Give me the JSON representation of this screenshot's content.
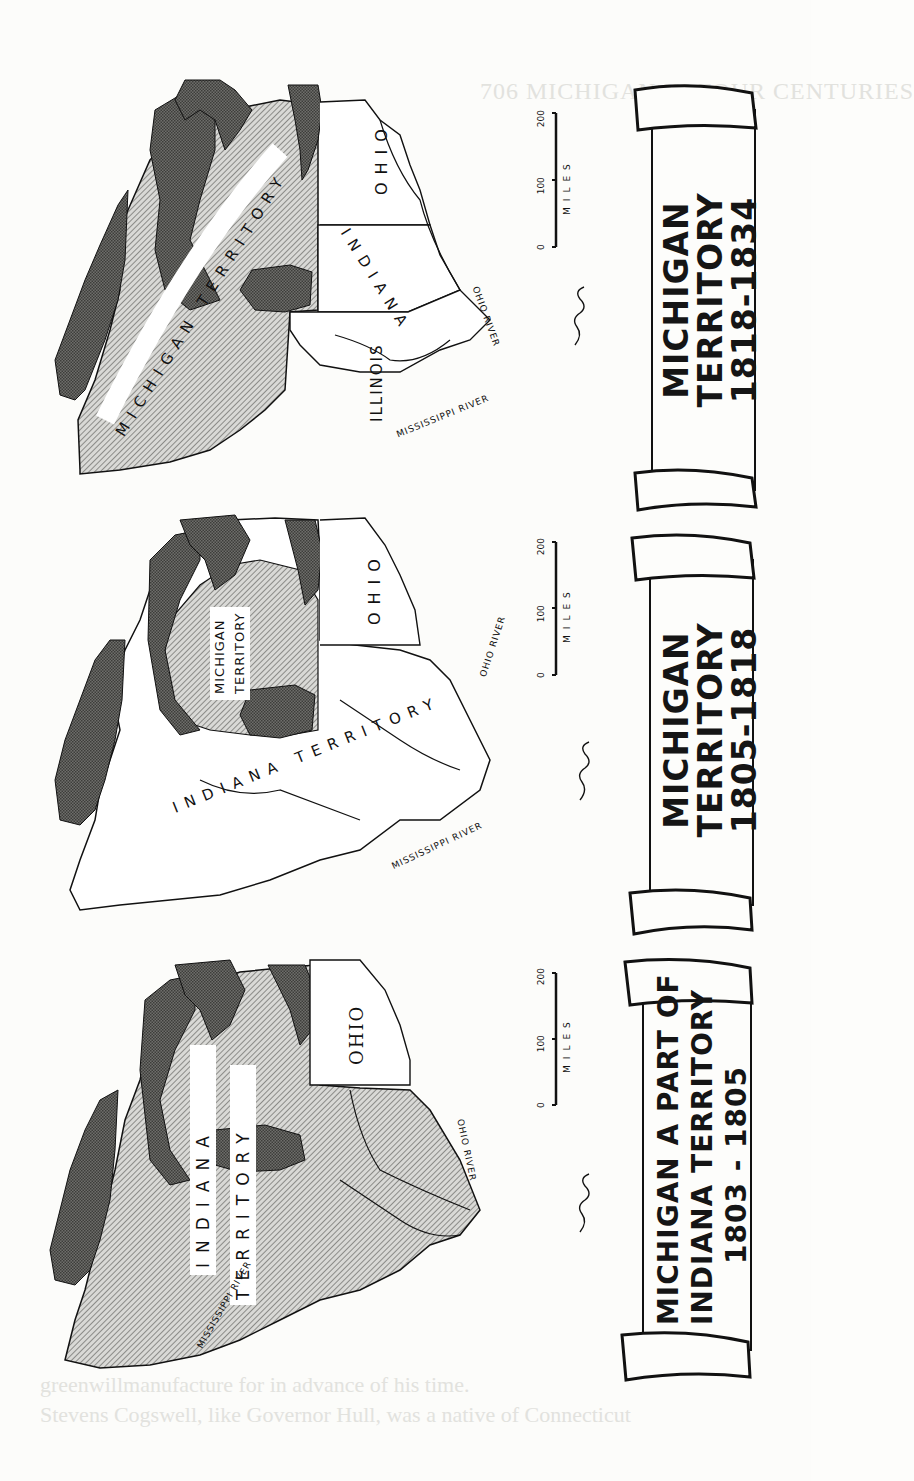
{
  "page": {
    "running_header": "706     MICHIGAN IN FOUR CENTURIES",
    "footer_lines": [
      "greenwillmanufacture for in advance of his time.",
      "Stevens Cogswell, like Governor Hull, was a native of Connecticut"
    ]
  },
  "maps": [
    {
      "id": "map-1818-1834",
      "scroll": {
        "lines": [
          "MICHIGAN",
          "TERRITORY",
          "1818-1834"
        ]
      },
      "labels": {
        "territory": "MICHIGAN TERRITORY",
        "ohio": "OHIO",
        "indiana": "INDIANA",
        "illinois": "ILLINOIS",
        "mississippi": "MISSISSIPPI RIVER",
        "ohio_river": "OHIO RIVER"
      },
      "scale": {
        "ticks": [
          "0",
          "100",
          "200"
        ],
        "unit": "MILES"
      }
    },
    {
      "id": "map-1805-1818",
      "scroll": {
        "lines": [
          "MICHIGAN",
          "TERRITORY",
          "1805-1818"
        ]
      },
      "labels": {
        "territory": "MICHIGAN TERRITORY",
        "territory_line1": "MICHIGAN",
        "territory_line2": "TERRITORY",
        "indiana_territory": "INDIANA TERRITORY",
        "ohio": "OHIO",
        "mississippi": "MISSISSIPPI RIVER",
        "ohio_river": "OHIO RIVER"
      },
      "scale": {
        "ticks": [
          "0",
          "100",
          "200"
        ],
        "unit": "MILES"
      }
    },
    {
      "id": "map-1803-1805",
      "scroll": {
        "lines": [
          "MICHIGAN  A PART OF",
          "INDIANA  TERRITORY",
          "1803 - 1805"
        ]
      },
      "labels": {
        "indiana": "INDIANA",
        "territory": "TERRITORY",
        "ohio": "OHIO",
        "mississippi": "MISSISSIPPI RIVER",
        "ohio_river": "OHIO RIVER"
      },
      "scale": {
        "ticks": [
          "0",
          "100",
          "200"
        ],
        "unit": "MILES"
      }
    }
  ]
}
